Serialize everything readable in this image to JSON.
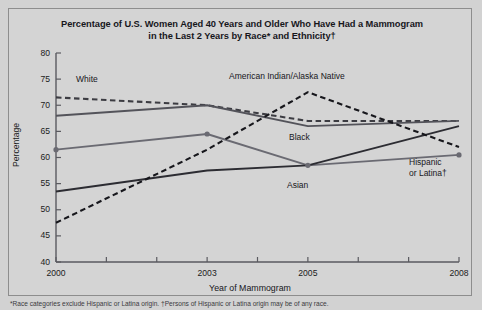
{
  "chart_data": {
    "type": "line",
    "title": "Percentage of U.S. Women Aged 40 Years and Older Who Have Had a Mammogram in the Last 2 Years by Race* and Ethnicity†",
    "title_line1": "Percentage of U.S. Women Aged 40 Years and Older Who Have Had a Mammogram",
    "title_line2": "in the Last 2 Years by Race* and Ethnicity†",
    "xlabel": "Year of Mammogram",
    "ylabel": "Percentage",
    "x": [
      2000,
      2003,
      2005,
      2008
    ],
    "xlim": [
      2000,
      2008
    ],
    "ylim": [
      40,
      80
    ],
    "yticks": [
      40,
      45,
      50,
      55,
      60,
      65,
      70,
      75,
      80
    ],
    "xticks": [
      2000,
      2001,
      2002,
      2003,
      2004,
      2005,
      2006,
      2007,
      2008
    ],
    "xtick_labels": [
      "2000",
      "",
      "",
      "2003",
      "",
      "2005",
      "",
      "",
      "2008"
    ],
    "grid": false,
    "legend_position": "inline-annotations",
    "series": [
      {
        "name": "White",
        "label": "White",
        "style": "dashed",
        "color": "#3c3c42",
        "marker": "none",
        "values": [
          71.5,
          70.0,
          67.0,
          67.0
        ]
      },
      {
        "name": "Black",
        "label": "Black",
        "style": "solid",
        "color": "#53535a",
        "marker": "none",
        "values": [
          68.0,
          70.0,
          66.0,
          67.0
        ]
      },
      {
        "name": "Hispanic or Latina",
        "label": "Hispanic\nor Latina†",
        "label_line1": "Hispanic",
        "label_line2": "or Latina†",
        "style": "solid",
        "color": "#6a6a72",
        "marker": "circle",
        "values": [
          61.5,
          64.5,
          58.5,
          60.5
        ]
      },
      {
        "name": "Asian",
        "label": "Asian",
        "style": "solid",
        "color": "#2c2c32",
        "marker": "none",
        "values": [
          53.5,
          57.5,
          58.5,
          66.0
        ]
      },
      {
        "name": "American Indian/Alaska Native",
        "label": "American Indian/Alaska Native",
        "style": "dashed",
        "color": "#17171c",
        "marker": "none",
        "values": [
          47.5,
          61.5,
          72.5,
          62.0
        ]
      }
    ],
    "footnote": "*Race categories exclude Hispanic or Latina origin. †Persons of Hispanic or Latina origin may be of any race."
  },
  "colors": {
    "background": "#d2d2d2",
    "axis": "#5a5a60",
    "text": "#17171c"
  }
}
